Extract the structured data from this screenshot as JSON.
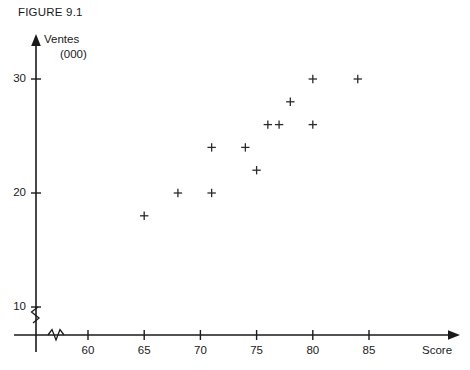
{
  "figure": {
    "title": "FIGURE 9.1"
  },
  "axes": {
    "y_label_line1": "Ventes",
    "y_label_line2": "(000)",
    "x_label": "Score",
    "y_ticks": [
      "10",
      "20",
      "30"
    ],
    "x_ticks": [
      "60",
      "65",
      "70",
      "75",
      "80",
      "85"
    ],
    "y_axis_break": "zigzag-break",
    "x_axis_break": "zigzag-break"
  },
  "style": {
    "axis_color": "#1a1a1a",
    "marker_color": "#2a2a2a",
    "background": "#ffffff"
  },
  "chart_data": {
    "type": "scatter",
    "title": "FIGURE 9.1",
    "xlabel": "Score",
    "ylabel": "Ventes (000)",
    "xlim": [
      57,
      88
    ],
    "ylim": [
      8,
      32
    ],
    "grid": false,
    "legend": false,
    "marker": "plus",
    "axis_breaks": {
      "x": true,
      "y": true
    },
    "x_tick_values": [
      60,
      65,
      70,
      75,
      80,
      85
    ],
    "y_tick_values": [
      10,
      20,
      30
    ],
    "points": [
      {
        "x": 65,
        "y": 18
      },
      {
        "x": 68,
        "y": 20
      },
      {
        "x": 71,
        "y": 20
      },
      {
        "x": 71,
        "y": 24
      },
      {
        "x": 74,
        "y": 24
      },
      {
        "x": 75,
        "y": 22
      },
      {
        "x": 76,
        "y": 26
      },
      {
        "x": 77,
        "y": 26
      },
      {
        "x": 78,
        "y": 28
      },
      {
        "x": 80,
        "y": 26
      },
      {
        "x": 80,
        "y": 30
      },
      {
        "x": 84,
        "y": 30
      }
    ]
  }
}
